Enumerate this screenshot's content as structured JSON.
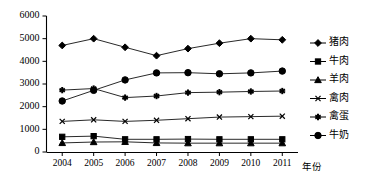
{
  "chart_data": {
    "type": "line",
    "title": "",
    "xlabel": "年份",
    "ylabel": "",
    "categories": [
      "2004",
      "2005",
      "2006",
      "2007",
      "2008",
      "2009",
      "2010",
      "2011"
    ],
    "ylim": [
      0,
      6000
    ],
    "ytick_labels": [
      "0",
      "1000",
      "2000",
      "3000",
      "4000",
      "5000",
      "6000"
    ],
    "ytick_values": [
      0,
      1000,
      2000,
      3000,
      4000,
      5000,
      6000
    ],
    "grid": false,
    "legend_position": "right",
    "series": [
      {
        "name": "猪肉",
        "marker": "diamond",
        "values": [
          4700,
          5000,
          4620,
          4250,
          4560,
          4800,
          5000,
          4950
        ]
      },
      {
        "name": "牛肉",
        "marker": "square",
        "values": [
          670,
          700,
          560,
          560,
          570,
          560,
          560,
          560
        ]
      },
      {
        "name": "羊肉",
        "marker": "triangle",
        "values": [
          400,
          440,
          450,
          400,
          390,
          390,
          390,
          390
        ]
      },
      {
        "name": "禽肉",
        "marker": "x",
        "values": [
          1350,
          1420,
          1350,
          1400,
          1470,
          1540,
          1560,
          1580
        ]
      },
      {
        "name": "禽蛋",
        "marker": "asterisk",
        "values": [
          2730,
          2800,
          2400,
          2470,
          2620,
          2640,
          2670,
          2690
        ]
      },
      {
        "name": "牛奶",
        "marker": "circle",
        "values": [
          2250,
          2720,
          3180,
          3490,
          3500,
          3450,
          3490,
          3570
        ]
      }
    ]
  },
  "colors": {
    "ink": "#000000",
    "line": "#111111",
    "background": "#ffffff"
  }
}
